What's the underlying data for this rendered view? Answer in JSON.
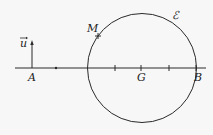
{
  "diagram": {
    "labels": {
      "vector_u": "u",
      "point_A": "A",
      "point_M": "M",
      "point_G": "G",
      "point_B": "B",
      "circle": "ℰ"
    },
    "colors": {
      "stroke": "#2a2a2a",
      "background": "#f7f7f7"
    }
  }
}
